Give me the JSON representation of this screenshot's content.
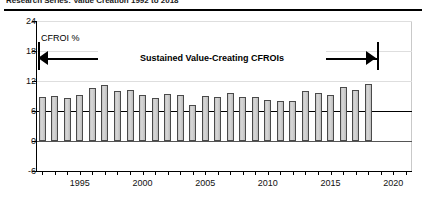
{
  "title": {
    "text": "Research Series: Value Creation 1992 to 2018"
  },
  "chart_data": {
    "type": "bar",
    "title": "",
    "xlabel": "",
    "ylabel": "CFROI %",
    "ylim": [
      -6,
      24
    ],
    "yticks": [
      24,
      18,
      12,
      6,
      0,
      -6
    ],
    "ytick_labels": [
      "24",
      "18",
      "12",
      "6",
      "0",
      "-6"
    ],
    "xlim": [
      1991.5,
      2021.5
    ],
    "xticks": [
      1992,
      1993,
      1994,
      1995,
      1996,
      1997,
      1998,
      1999,
      2000,
      2001,
      2002,
      2003,
      2004,
      2005,
      2006,
      2007,
      2008,
      2009,
      2010,
      2011,
      2012,
      2013,
      2014,
      2015,
      2016,
      2017,
      2018,
      2019,
      2020,
      2021
    ],
    "xtick_labels_shown": [
      "1995",
      "2000",
      "2005",
      "2010",
      "2015",
      "2020"
    ],
    "xtick_labels_shown_values": [
      1995,
      2000,
      2005,
      2010,
      2015,
      2020
    ],
    "grid": true,
    "legend": false,
    "reference_line": {
      "value": 6,
      "label": ""
    },
    "zero_line": {
      "value": 0
    },
    "bar_color": "#cccccc",
    "bar_edge_color": "#4a4a4a",
    "categories": [
      1992,
      1993,
      1994,
      1995,
      1996,
      1997,
      1998,
      1999,
      2000,
      2001,
      2002,
      2003,
      2004,
      2005,
      2006,
      2007,
      2008,
      2009,
      2010,
      2011,
      2012,
      2013,
      2014,
      2015,
      2016,
      2017,
      2018
    ],
    "values": [
      8.9,
      9.1,
      8.6,
      9.3,
      10.6,
      11.2,
      10.1,
      10.2,
      9.3,
      8.6,
      9.4,
      9.2,
      7.3,
      9.0,
      8.8,
      9.6,
      8.9,
      8.9,
      8.3,
      8.0,
      8.1,
      10.1,
      9.7,
      9.2,
      10.8,
      10.3,
      11.4
    ]
  },
  "annotation": {
    "cfroi_label": "CFROI %",
    "band_label": "Sustained Value-Creating CFROIs"
  }
}
